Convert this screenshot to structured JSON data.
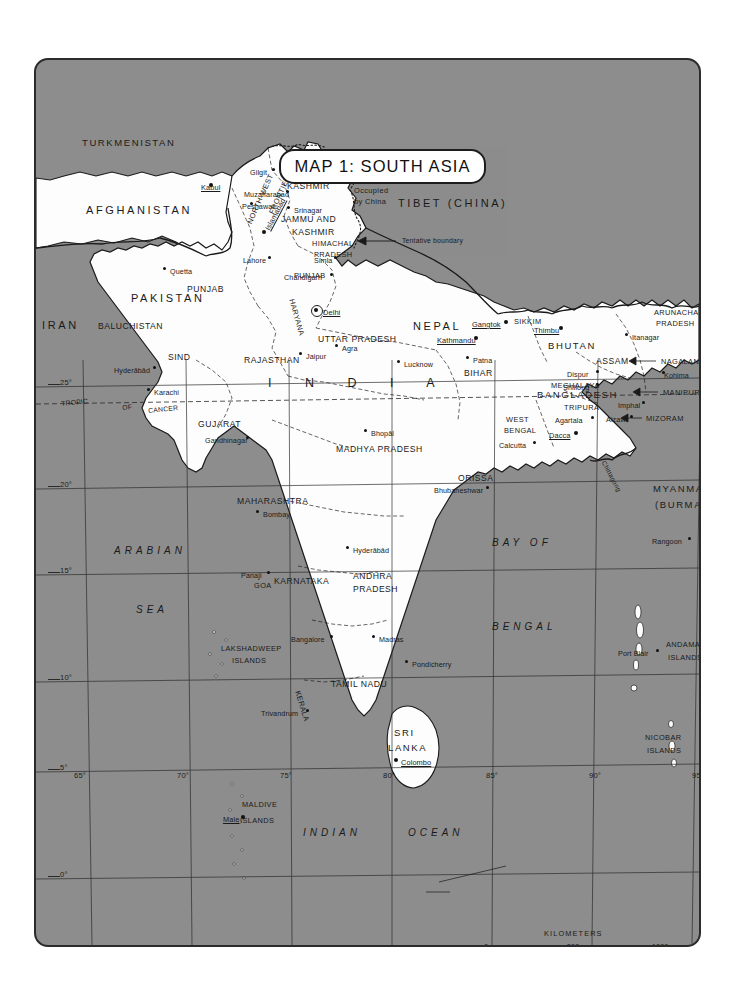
{
  "title": "MAP 1: SOUTH ASIA",
  "credit": "RJS",
  "colors": {
    "sea": "#8d8d8d",
    "land": "#fdfdfd",
    "ink": "#1a1a1a",
    "frame": "#2b2b2b"
  },
  "countries": [
    {
      "name": "TURKMENISTAN",
      "x": 46,
      "y": 78,
      "cls": "country-sm"
    },
    {
      "name": "AFGHANISTAN",
      "x": 50,
      "y": 145,
      "cls": "country"
    },
    {
      "name": "IRAN",
      "x": 6,
      "y": 260,
      "cls": "country"
    },
    {
      "name": "PAKISTAN",
      "x": 95,
      "y": 233,
      "cls": "country"
    },
    {
      "name": "TIBET (CHINA)",
      "x": 362,
      "y": 138,
      "cls": "country"
    },
    {
      "name": "NEPAL",
      "x": 377,
      "y": 261,
      "cls": "country"
    },
    {
      "name": "BHUTAN",
      "x": 512,
      "y": 281,
      "cls": "country-sm"
    },
    {
      "name": "BANGLADESH",
      "x": 501,
      "y": 330,
      "cls": "country-sm"
    },
    {
      "name": "MYANMAR",
      "x": 617,
      "y": 424,
      "cls": "country-sm"
    },
    {
      "name": "(BURMA)",
      "x": 619,
      "y": 440,
      "cls": "country-sm"
    },
    {
      "name": "SRI",
      "x": 358,
      "y": 668,
      "cls": "country-sm"
    },
    {
      "name": "LANKA",
      "x": 352,
      "y": 683,
      "cls": "country-sm"
    }
  ],
  "india_letters": {
    "text": "I N D I A",
    "x": 232,
    "y": 317
  },
  "states": [
    {
      "name": "NORTH-WEST",
      "x": 210,
      "y": 162,
      "rot": -66,
      "cls": "state-sm"
    },
    {
      "name": "FRONTIER",
      "x": 232,
      "y": 152,
      "rot": -66,
      "cls": "state-sm"
    },
    {
      "name": "AZAD",
      "x": 258,
      "y": 110,
      "cls": "state"
    },
    {
      "name": "KASHMIR",
      "x": 251,
      "y": 122,
      "cls": "state"
    },
    {
      "name": "JAMMU AND",
      "x": 245,
      "y": 155,
      "cls": "state"
    },
    {
      "name": "KASHMIR",
      "x": 256,
      "y": 168,
      "cls": "state"
    },
    {
      "name": "Occupied",
      "x": 318,
      "y": 127,
      "cls": "state-sm"
    },
    {
      "name": "by China",
      "x": 318,
      "y": 138,
      "cls": "state-sm"
    },
    {
      "name": "HIMACHAL",
      "x": 276,
      "y": 180,
      "cls": "state-sm"
    },
    {
      "name": "PRADESH",
      "x": 278,
      "y": 191,
      "cls": "state-sm"
    },
    {
      "name": "PUNJAB",
      "x": 151,
      "y": 225,
      "cls": "state"
    },
    {
      "name": "PUNJAB",
      "x": 258,
      "y": 212,
      "cls": "state-sm"
    },
    {
      "name": "HARYANA",
      "x": 259,
      "y": 238,
      "rot": 74,
      "cls": "state-sm"
    },
    {
      "name": "BALUCHISTAN",
      "x": 62,
      "y": 262,
      "cls": "state"
    },
    {
      "name": "SIND",
      "x": 132,
      "y": 293,
      "cls": "state"
    },
    {
      "name": "RAJASTHAN",
      "x": 208,
      "y": 296,
      "cls": "state"
    },
    {
      "name": "UTTAR PRADESH",
      "x": 282,
      "y": 275,
      "cls": "state"
    },
    {
      "name": "BIHAR",
      "x": 428,
      "y": 309,
      "cls": "state"
    },
    {
      "name": "SIKKIM",
      "x": 478,
      "y": 258,
      "cls": "state-sm"
    },
    {
      "name": "ARUNACHAL",
      "x": 618,
      "y": 249,
      "cls": "state-sm"
    },
    {
      "name": "PRADESH",
      "x": 620,
      "y": 260,
      "cls": "state-sm"
    },
    {
      "name": "ASSAM",
      "x": 560,
      "y": 297,
      "cls": "state"
    },
    {
      "name": "NAGALAND",
      "x": 625,
      "y": 298,
      "cls": "state-sm"
    },
    {
      "name": "MANIPUR",
      "x": 627,
      "y": 329,
      "cls": "state-sm"
    },
    {
      "name": "MEGHALAYA",
      "x": 515,
      "y": 322,
      "cls": "state-sm"
    },
    {
      "name": "TRIPURA",
      "x": 528,
      "y": 344,
      "cls": "state-sm"
    },
    {
      "name": "MIZORAM",
      "x": 610,
      "y": 355,
      "cls": "state-sm"
    },
    {
      "name": "WEST",
      "x": 470,
      "y": 356,
      "cls": "state-sm"
    },
    {
      "name": "BENGAL",
      "x": 468,
      "y": 367,
      "cls": "state-sm"
    },
    {
      "name": "GUJARAT",
      "x": 162,
      "y": 360,
      "cls": "state"
    },
    {
      "name": "MADHYA PRADESH",
      "x": 300,
      "y": 385,
      "cls": "state"
    },
    {
      "name": "ORISSA",
      "x": 422,
      "y": 414,
      "cls": "state"
    },
    {
      "name": "MAHARASHTRA",
      "x": 201,
      "y": 437,
      "cls": "state"
    },
    {
      "name": "ANDHRA",
      "x": 317,
      "y": 512,
      "cls": "state"
    },
    {
      "name": "PRADESH",
      "x": 317,
      "y": 525,
      "cls": "state"
    },
    {
      "name": "KARNATAKA",
      "x": 238,
      "y": 517,
      "cls": "state"
    },
    {
      "name": "GOA",
      "x": 218,
      "y": 522,
      "cls": "state-sm"
    },
    {
      "name": "TAMIL NADU",
      "x": 295,
      "y": 620,
      "cls": "state"
    },
    {
      "name": "KERALA",
      "x": 265,
      "y": 630,
      "rot": 73,
      "cls": "state-sm"
    },
    {
      "name": "LAKSHADWEEP",
      "x": 185,
      "y": 585,
      "cls": "state-sm"
    },
    {
      "name": "ISLANDS",
      "x": 196,
      "y": 597,
      "cls": "state-sm"
    },
    {
      "name": "ANDAMAN",
      "x": 630,
      "y": 581,
      "cls": "state-sm"
    },
    {
      "name": "ISLANDS",
      "x": 632,
      "y": 594,
      "cls": "state-sm"
    },
    {
      "name": "NICOBAR",
      "x": 609,
      "y": 674,
      "cls": "state-sm"
    },
    {
      "name": "ISLANDS",
      "x": 611,
      "y": 687,
      "cls": "state-sm"
    },
    {
      "name": "MALDIVE",
      "x": 206,
      "y": 741,
      "cls": "state-sm"
    },
    {
      "name": "ISLANDS",
      "x": 204,
      "y": 757,
      "cls": "state-sm"
    }
  ],
  "cities": [
    {
      "name": "Kabul",
      "x": 175,
      "y": 125,
      "dx": -10,
      "dy": 3,
      "capital": true
    },
    {
      "name": "Peshawar",
      "x": 216,
      "y": 144,
      "dx": -10,
      "dy": 3,
      "capital": false
    },
    {
      "name": "Islamabad",
      "x": 228,
      "y": 172,
      "rot": -62,
      "dx": 0,
      "dy": 0,
      "capital": true
    },
    {
      "name": "Gilgit",
      "x": 238,
      "y": 110,
      "dx": -24,
      "dy": 3,
      "capital": false
    },
    {
      "name": "Muzaffarabad",
      "x": 252,
      "y": 132,
      "dx": -44,
      "dy": 3,
      "capital": false
    },
    {
      "name": "Srinagar",
      "x": 253,
      "y": 148,
      "dx": 5,
      "dy": 3,
      "capital": false
    },
    {
      "name": "Simla",
      "x": 300,
      "y": 198,
      "dx": -22,
      "dy": 3,
      "capital": false
    },
    {
      "name": "Chandigarh",
      "x": 296,
      "y": 215,
      "dx": -48,
      "dy": 3,
      "capital": false
    },
    {
      "name": "Lahore",
      "x": 234,
      "y": 198,
      "dx": -27,
      "dy": 3,
      "capital": false
    },
    {
      "name": "Quetta",
      "x": 129,
      "y": 209,
      "dx": 5,
      "dy": 3,
      "capital": false
    },
    {
      "name": "Delhi",
      "x": 280,
      "y": 250,
      "dx": 7,
      "dy": 3,
      "capital": true
    },
    {
      "name": "Jaipur",
      "x": 265,
      "y": 294,
      "dx": 5,
      "dy": 3,
      "capital": false
    },
    {
      "name": "Agra",
      "x": 301,
      "y": 286,
      "dx": 5,
      "dy": 3,
      "capital": false
    },
    {
      "name": "Lucknow",
      "x": 363,
      "y": 302,
      "dx": 5,
      "dy": 3,
      "capital": false
    },
    {
      "name": "Kathmandu",
      "x": 440,
      "y": 278,
      "dx": -39,
      "dy": 3,
      "capital": true
    },
    {
      "name": "Gangtok",
      "x": 470,
      "y": 262,
      "dx": -34,
      "dy": 3,
      "capital": true
    },
    {
      "name": "Thimbu",
      "x": 525,
      "y": 268,
      "dx": -27,
      "dy": 3,
      "capital": true
    },
    {
      "name": "Itanagar",
      "x": 591,
      "y": 275,
      "dx": 5,
      "dy": 3,
      "capital": false
    },
    {
      "name": "Dispur",
      "x": 562,
      "y": 312,
      "dx": -31,
      "dy": 3,
      "capital": false
    },
    {
      "name": "Shillong",
      "x": 562,
      "y": 325,
      "dx": -35,
      "dy": 3,
      "capital": false
    },
    {
      "name": "Kohima",
      "x": 628,
      "y": 313,
      "dx": 0,
      "dy": 3,
      "capital": false
    },
    {
      "name": "Imphal",
      "x": 608,
      "y": 343,
      "dx": -26,
      "dy": 3,
      "capital": false
    },
    {
      "name": "Agartala",
      "x": 557,
      "y": 358,
      "dx": -38,
      "dy": 3,
      "capital": false
    },
    {
      "name": "Aizawl",
      "x": 596,
      "y": 357,
      "dx": -26,
      "dy": 3,
      "capital": false
    },
    {
      "name": "Dacca",
      "x": 540,
      "y": 373,
      "dx": -27,
      "dy": 3,
      "capital": true
    },
    {
      "name": "Patna",
      "x": 432,
      "y": 298,
      "dx": 5,
      "dy": 3,
      "capital": false
    },
    {
      "name": "Calcutta",
      "x": 499,
      "y": 383,
      "dx": -36,
      "dy": 3,
      "capital": false
    },
    {
      "name": "Karachi",
      "x": 113,
      "y": 330,
      "dx": 5,
      "dy": 3,
      "capital": false
    },
    {
      "name": "Hyderābād",
      "x": 119,
      "y": 308,
      "dx": -41,
      "dy": 3,
      "capital": false
    },
    {
      "name": "Gandhinagar",
      "x": 212,
      "y": 378,
      "dx": -43,
      "dy": 3,
      "capital": false
    },
    {
      "name": "Bhopāl",
      "x": 330,
      "y": 371,
      "dx": 5,
      "dy": 3,
      "capital": false
    },
    {
      "name": "Bhubaneshwar",
      "x": 452,
      "y": 428,
      "dx": -54,
      "dy": 3,
      "capital": false
    },
    {
      "name": "Bombay",
      "x": 222,
      "y": 452,
      "dx": 5,
      "dy": 3,
      "capital": false
    },
    {
      "name": "Hyderābād",
      "x": 312,
      "y": 488,
      "dx": 5,
      "dy": 3,
      "capital": false
    },
    {
      "name": "Panaji",
      "x": 233,
      "y": 513,
      "dx": -28,
      "dy": 3,
      "capital": false
    },
    {
      "name": "Bangalore",
      "x": 296,
      "y": 577,
      "dx": -41,
      "dy": 3,
      "capital": false
    },
    {
      "name": "Madras",
      "x": 338,
      "y": 577,
      "dx": 5,
      "dy": 3,
      "capital": false
    },
    {
      "name": "Pondicherry",
      "x": 371,
      "y": 602,
      "dx": 5,
      "dy": 3,
      "capital": false
    },
    {
      "name": "Trivandrum",
      "x": 272,
      "y": 651,
      "dx": -47,
      "dy": 3,
      "capital": false
    },
    {
      "name": "Colombo",
      "x": 360,
      "y": 700,
      "dx": 5,
      "dy": 3,
      "capital": true
    },
    {
      "name": "Rangoon",
      "x": 654,
      "y": 479,
      "dx": -38,
      "dy": 3,
      "capital": false
    },
    {
      "name": "Port Blair",
      "x": 622,
      "y": 591,
      "dx": -40,
      "dy": 3,
      "capital": false
    },
    {
      "name": "Male",
      "x": 207,
      "y": 757,
      "dx": -20,
      "dy": 3,
      "capital": true
    }
  ],
  "water_labels": [
    {
      "name": "ARABIAN",
      "x": 78,
      "y": 486,
      "cls": "water"
    },
    {
      "name": "SEA",
      "x": 100,
      "y": 545,
      "cls": "water"
    },
    {
      "name": "BAY  OF",
      "x": 456,
      "y": 478,
      "cls": "water"
    },
    {
      "name": "BENGAL",
      "x": 456,
      "y": 562,
      "cls": "water"
    },
    {
      "name": "INDIAN",
      "x": 267,
      "y": 768,
      "cls": "water"
    },
    {
      "name": "OCEAN",
      "x": 372,
      "y": 768,
      "cls": "water"
    },
    {
      "name": "Chittagong",
      "x": 570,
      "y": 400,
      "cls": "tiny",
      "rot": 62
    }
  ],
  "annotations": [
    {
      "name": "Tentative boundary",
      "x": 366,
      "y": 178
    },
    {
      "name": "TROPIC",
      "x": 25,
      "y": 341,
      "rot": -6
    },
    {
      "name": "OF",
      "x": 86,
      "y": 345,
      "rot": -6
    },
    {
      "name": "CANCER",
      "x": 112,
      "y": 348,
      "rot": -6
    }
  ],
  "graticule": {
    "latitudes": [
      "25°",
      "20°",
      "15°",
      "10°",
      "5°",
      "0°"
    ],
    "longitudes": [
      "65°",
      "70°",
      "75°",
      "80°",
      "85°",
      "90°",
      "95°"
    ],
    "lat_positions": [
      325,
      427,
      513,
      620,
      710,
      817
    ],
    "lon_positions": [
      47,
      150,
      253,
      356,
      459,
      562,
      665
    ]
  },
  "scale": {
    "caption": "KILOMETERS",
    "t0": "0",
    "t500": "500",
    "t1000": "1000"
  }
}
